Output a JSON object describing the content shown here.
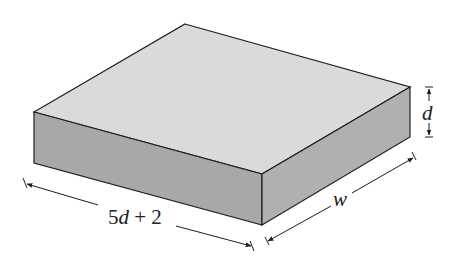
{
  "figure": {
    "type": "rectangular slab (box)",
    "colors": {
      "top_face": "#dadada",
      "front_face": "#a8a8a8",
      "side_face": "#b0b0b0",
      "edge": "#1e1e1e",
      "background": "#ffffff"
    }
  },
  "dimensions": {
    "length": {
      "coef": "5",
      "var": "d",
      "rest": " + 2"
    },
    "width": {
      "var": "w"
    },
    "depth": {
      "var": "d"
    }
  }
}
